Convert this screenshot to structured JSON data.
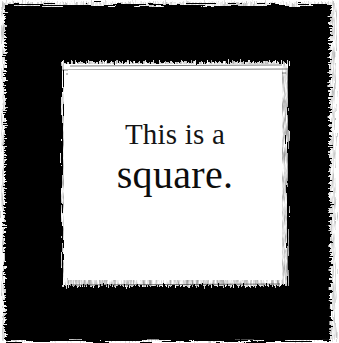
{
  "artwork": {
    "title": "This is a square.",
    "medium": "drybrush-painted black square frame",
    "background_color": "#ffffff",
    "ink_color": "#000000",
    "text_color": "#111111",
    "canvas": {
      "width": 339,
      "height": 343
    },
    "frame": {
      "outer_left": 4,
      "outer_top": 4,
      "outer_right": 330,
      "outer_bottom": 341,
      "inner_left": 62,
      "inner_top": 62,
      "inner_right": 288,
      "inner_bottom": 286,
      "band_color": "#000000",
      "interior_color": "#ffffff"
    }
  },
  "caption": {
    "line_one": "This is a",
    "line_two": "square."
  }
}
